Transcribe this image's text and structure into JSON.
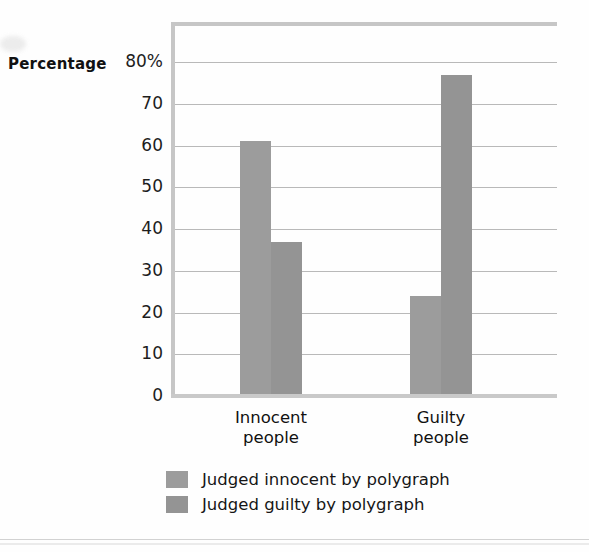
{
  "axis_title": "Percentage",
  "chart_data": {
    "type": "bar",
    "title": "",
    "subtitle": "",
    "xlabel": "",
    "ylabel": "Percentage",
    "ylim": [
      0,
      80
    ],
    "yticks": [
      80,
      70,
      60,
      50,
      40,
      30,
      20,
      10,
      0
    ],
    "ytick_labels": [
      "80%",
      "70",
      "60",
      "50",
      "40",
      "30",
      "20",
      "10",
      "0"
    ],
    "grid": true,
    "legend_position": "bottom",
    "categories": [
      "Innocent people",
      "Guilty people"
    ],
    "category_lines": [
      [
        "Innocent",
        "people"
      ],
      [
        "Guilty",
        "people"
      ]
    ],
    "series": [
      {
        "name": "Judged innocent by polygraph",
        "color": "#9c9c9c",
        "values": [
          61,
          24
        ]
      },
      {
        "name": "Judged guilty by polygraph",
        "color": "#949494",
        "values": [
          37,
          77
        ]
      }
    ]
  },
  "legend": {
    "items": [
      {
        "label": "Judged innocent by polygraph",
        "color": "#9c9c9c"
      },
      {
        "label": "Judged guilty by polygraph",
        "color": "#949494"
      }
    ]
  },
  "colors": {
    "bar_light": "#9c9c9c",
    "bar_dark": "#949494",
    "gridline": "#b9b9b9",
    "frame": "#c6c6c6",
    "text": "#1a1a1a",
    "background": "#ffffff"
  }
}
